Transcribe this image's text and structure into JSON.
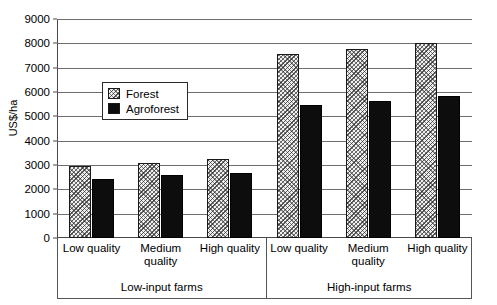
{
  "chart_data": {
    "type": "bar",
    "title": "",
    "xlabel": "",
    "ylabel": "US$/ha",
    "ylim": [
      0,
      9000
    ],
    "ytick_step": 1000,
    "yticks": [
      "0",
      "1000",
      "2000",
      "3000",
      "4000",
      "5000",
      "6000",
      "7000",
      "8000",
      "9000"
    ],
    "grid": true,
    "legend_position": "inside-upper-left",
    "categories": [
      "Low quality",
      "Medium quality",
      "High quality",
      "Low quality",
      "Medium quality",
      "High quality"
    ],
    "groups": [
      {
        "label": "Low-input farms",
        "categories": [
          "Low quality",
          "Medium quality",
          "High quality"
        ]
      },
      {
        "label": "High-input farms",
        "categories": [
          "Low quality",
          "Medium quality",
          "High quality"
        ]
      }
    ],
    "series": [
      {
        "name": "Forest",
        "color": "#efefef",
        "pattern": "hatched",
        "values": [
          2980,
          3100,
          3250,
          7550,
          7780,
          8000
        ]
      },
      {
        "name": "Agroforest",
        "color": "#0d0d0d",
        "pattern": "solid",
        "values": [
          2420,
          2570,
          2690,
          5480,
          5650,
          5820
        ]
      }
    ]
  },
  "legend": {
    "items": [
      {
        "label": "Forest"
      },
      {
        "label": "Agroforest"
      }
    ]
  }
}
